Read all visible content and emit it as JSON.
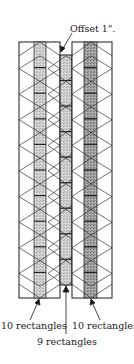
{
  "diagram": {
    "type": "quilt-strip-layout",
    "annotations": {
      "offset": "Offset 1\".",
      "left_count": "10 rectangles",
      "right_count": "10 rectangles",
      "center_count": "9 rectangles"
    },
    "strips": [
      {
        "name": "left",
        "rectangles": 10,
        "offset": 0
      },
      {
        "name": "center",
        "rectangles": 9,
        "offset": 1
      },
      {
        "name": "right",
        "rectangles": 10,
        "offset": 0
      }
    ],
    "colors": {
      "outline": "#1a1a1a",
      "fill_light": "#d9d9d9",
      "fill_mid": "#bdbdbd",
      "fill_dark": "#7a7a7a"
    }
  }
}
